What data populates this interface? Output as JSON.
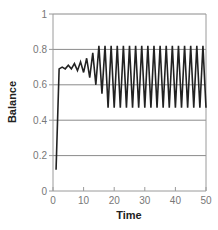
{
  "chart_data": {
    "type": "line",
    "title": "",
    "xlabel": "Time",
    "ylabel": "Balance",
    "xlim": [
      0,
      50
    ],
    "ylim": [
      0,
      1
    ],
    "xticks": [
      0,
      10,
      20,
      30,
      40,
      50
    ],
    "yticks": [
      0,
      0.2,
      0.4,
      0.6,
      0.8,
      1
    ],
    "ytick_labels": [
      "0",
      "0.2",
      "0.4",
      "0.6",
      "0.8",
      "1"
    ],
    "xtick_labels": [
      "0",
      "10",
      "20",
      "30",
      "40",
      "50"
    ],
    "grid": "horizontal",
    "legend": null,
    "series": [
      {
        "name": "Balance",
        "color": "#222222",
        "x": [
          1,
          2,
          3,
          4,
          5,
          6,
          7,
          8,
          9,
          10,
          11,
          12,
          13,
          14,
          15,
          16,
          17,
          18,
          19,
          20,
          21,
          22,
          23,
          24,
          25,
          26,
          27,
          28,
          29,
          30,
          31,
          32,
          33,
          34,
          35,
          36,
          37,
          38,
          39,
          40,
          41,
          42,
          43,
          44,
          45,
          46,
          47,
          48,
          49,
          50
        ],
        "values": [
          0.12,
          0.69,
          0.7,
          0.69,
          0.71,
          0.69,
          0.72,
          0.68,
          0.73,
          0.67,
          0.75,
          0.64,
          0.78,
          0.6,
          0.82,
          0.55,
          0.82,
          0.47,
          0.82,
          0.47,
          0.82,
          0.47,
          0.82,
          0.47,
          0.82,
          0.47,
          0.82,
          0.47,
          0.82,
          0.47,
          0.82,
          0.47,
          0.82,
          0.47,
          0.82,
          0.47,
          0.82,
          0.47,
          0.82,
          0.47,
          0.82,
          0.47,
          0.82,
          0.47,
          0.82,
          0.47,
          0.82,
          0.47,
          0.82,
          0.47
        ]
      }
    ]
  },
  "colors": {
    "axis": "#9a9a9a",
    "grid": "#8a8a8a",
    "line": "#222222",
    "tick_text": "#777777",
    "title_text": "#222222"
  }
}
